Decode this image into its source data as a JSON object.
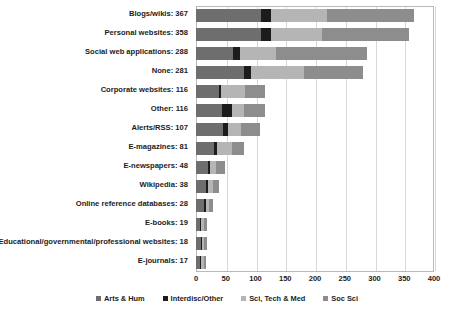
{
  "chart_data": {
    "type": "bar",
    "orientation": "horizontal",
    "stacked": true,
    "title": "",
    "subtitle": "",
    "xlabel": "",
    "ylabel": "",
    "xlim": [
      0,
      400
    ],
    "xticks": [
      "0",
      "50",
      "100",
      "150",
      "200",
      "250",
      "300",
      "350",
      "400"
    ],
    "xtick_values": [
      0,
      50,
      100,
      150,
      200,
      250,
      300,
      350,
      400
    ],
    "grid": "vertical",
    "legend_position": "bottom",
    "categories": [
      "Blogs/wikis: 367",
      "Personal websites: 358",
      "Social web applications: 288",
      "None: 281",
      "Corporate websites: 116",
      "Other: 116",
      "Alerts/RSS: 107",
      "E-magazines: 81",
      "E-newspapers: 48",
      "Wikipedia: 38",
      "Online reference databases: 28",
      "E-books: 19",
      "Educational/governmental/professional websites: 18",
      "E-journals: 17"
    ],
    "totals": [
      367,
      358,
      288,
      281,
      116,
      116,
      107,
      81,
      48,
      38,
      28,
      19,
      18,
      17
    ],
    "series": [
      {
        "name": "Arts & Hum",
        "color": "#6e6e6e",
        "values": [
          110,
          110,
          62,
          80,
          38,
          43,
          46,
          30,
          20,
          17,
          13,
          7,
          8,
          7
        ]
      },
      {
        "name": "Interdisc/Other",
        "color": "#1c1c1c",
        "values": [
          16,
          16,
          12,
          12,
          4,
          17,
          8,
          5,
          3,
          3,
          3,
          2,
          2,
          2
        ]
      },
      {
        "name": "Sci, Tech & Med",
        "color": "#b5b5b5",
        "values": [
          95,
          85,
          60,
          90,
          40,
          21,
          21,
          25,
          11,
          8,
          6,
          5,
          4,
          4
        ]
      },
      {
        "name": "Soc Sci",
        "color": "#8d8d8d",
        "values": [
          146,
          147,
          154,
          99,
          34,
          35,
          32,
          21,
          14,
          10,
          6,
          5,
          4,
          4
        ]
      }
    ]
  },
  "legend": {
    "items": [
      {
        "label": "Arts & Hum",
        "color": "#6e6e6e"
      },
      {
        "label": "Interdisc/Other",
        "color": "#1c1c1c"
      },
      {
        "label": "Sci, Tech & Med",
        "color": "#b5b5b5"
      },
      {
        "label": "Soc Sci",
        "color": "#8d8d8d"
      }
    ]
  },
  "colors": {
    "plot_border": "#b9b9b9",
    "gridline": "#d8d8d8",
    "background": "#ffffff",
    "text": "#1c1c1c"
  }
}
